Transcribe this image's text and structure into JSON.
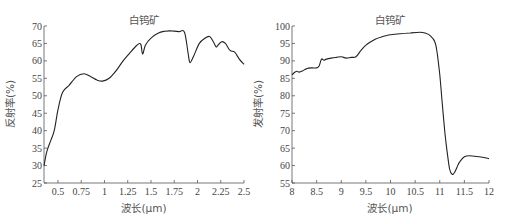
{
  "chart_data": [
    {
      "type": "line",
      "title": "白钨矿",
      "xlabel": "波长(μm)",
      "ylabel": "反射率(%)",
      "xlim": [
        0.35,
        2.5
      ],
      "ylim": [
        25,
        70
      ],
      "xticks": [
        0.5,
        0.75,
        1,
        1.25,
        1.5,
        1.75,
        2,
        2.25,
        2.5
      ],
      "xtick_labels": [
        "0.5",
        "0.75",
        "1",
        "1.25",
        "1.5",
        "1.75",
        "2",
        "2.25",
        "2.5"
      ],
      "yticks": [
        25,
        30,
        35,
        40,
        45,
        50,
        55,
        60,
        65,
        70
      ],
      "ytick_labels": [
        "25",
        "30",
        "35",
        "40",
        "45",
        "50",
        "55",
        "60",
        "65",
        "70"
      ],
      "grid": false,
      "series": [
        {
          "name": "白钨矿",
          "x": [
            0.35,
            0.38,
            0.42,
            0.46,
            0.5,
            0.55,
            0.62,
            0.7,
            0.78,
            0.85,
            0.92,
            0.98,
            1.05,
            1.12,
            1.2,
            1.28,
            1.35,
            1.39,
            1.41,
            1.44,
            1.5,
            1.58,
            1.65,
            1.72,
            1.8,
            1.86,
            1.9,
            1.92,
            1.96,
            2.02,
            2.08,
            2.13,
            2.17,
            2.2,
            2.22,
            2.26,
            2.3,
            2.35,
            2.4,
            2.45,
            2.5
          ],
          "y": [
            30,
            34,
            37,
            40,
            46,
            51,
            53,
            55.5,
            56.3,
            55.5,
            54.5,
            54.2,
            55,
            57,
            60,
            62.5,
            64.5,
            64.8,
            62,
            64.5,
            66.5,
            68,
            68.5,
            68.6,
            68.4,
            68.2,
            62,
            59.5,
            61.5,
            65,
            66.5,
            67,
            65.5,
            64,
            64.5,
            65.5,
            65,
            63,
            62.5,
            60.5,
            59
          ]
        }
      ]
    },
    {
      "type": "line",
      "title": "白钨矿",
      "xlabel": "波长(μm)",
      "ylabel": "发射率(%)",
      "xlim": [
        8,
        12
      ],
      "ylim": [
        55,
        100
      ],
      "xticks": [
        8,
        8.5,
        9,
        9.5,
        10,
        10.5,
        11,
        11.5,
        12
      ],
      "xtick_labels": [
        "8",
        "8.5",
        "9",
        "9.5",
        "10",
        "10.5",
        "11",
        "11.5",
        "12"
      ],
      "yticks": [
        55,
        60,
        65,
        70,
        75,
        80,
        85,
        90,
        95,
        100
      ],
      "ytick_labels": [
        "55",
        "60",
        "65",
        "70",
        "75",
        "80",
        "85",
        "90",
        "95",
        "100"
      ],
      "grid": false,
      "series": [
        {
          "name": "白钨矿",
          "x": [
            8,
            8.08,
            8.15,
            8.22,
            8.3,
            8.4,
            8.5,
            8.55,
            8.6,
            8.65,
            8.7,
            8.8,
            8.9,
            9.0,
            9.1,
            9.2,
            9.3,
            9.4,
            9.5,
            9.6,
            9.7,
            9.8,
            9.9,
            10.0,
            10.2,
            10.4,
            10.6,
            10.7,
            10.8,
            10.9,
            10.95,
            11.0,
            11.05,
            11.1,
            11.15,
            11.2,
            11.25,
            11.3,
            11.35,
            11.4,
            11.5,
            11.6,
            11.8,
            12.0
          ],
          "y": [
            86,
            87,
            86.8,
            87.2,
            87.8,
            88,
            88,
            88.5,
            90.5,
            90.2,
            90.5,
            90.8,
            91,
            91.2,
            90.8,
            91,
            91.2,
            93,
            94.5,
            95.5,
            96.3,
            96.8,
            97.2,
            97.5,
            97.8,
            98,
            98.2,
            98,
            97.3,
            95.5,
            92,
            86,
            78,
            70,
            64,
            59,
            57.5,
            58,
            59.5,
            61,
            62.5,
            62.8,
            62.5,
            62
          ]
        }
      ]
    }
  ]
}
